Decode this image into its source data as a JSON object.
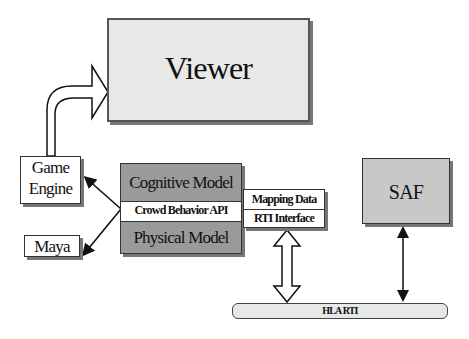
{
  "diagram": {
    "nodes": {
      "viewer": {
        "label": "Viewer"
      },
      "game_engine": {
        "line1": "Game",
        "line2": "Engine"
      },
      "maya": {
        "label": "Maya"
      },
      "cognitive_model": {
        "label": "Cognitive Model"
      },
      "crowd_behavior_api": {
        "label": "Crowd Behavior API"
      },
      "physical_model": {
        "label": "Physical Model"
      },
      "mapping_data": {
        "label": "Mapping Data"
      },
      "rti_interface": {
        "label": "RTI Interface"
      },
      "saf": {
        "label": "SAF"
      },
      "hla_rti": {
        "label": "HLA RTI"
      }
    },
    "edges": [
      {
        "from": "game_engine",
        "to": "viewer",
        "style": "hollow-curved-arrow"
      },
      {
        "from": "crowd_behavior_api",
        "to": "game_engine",
        "style": "arrow"
      },
      {
        "from": "crowd_behavior_api",
        "to": "maya",
        "style": "arrow"
      },
      {
        "from": "rti_interface",
        "to": "hla_rti",
        "style": "hollow-double-arrow"
      },
      {
        "from": "saf",
        "to": "hla_rti",
        "style": "double-arrow"
      }
    ],
    "colors": {
      "light_box": "#e6e6e6",
      "dark_box": "#9a9a9a",
      "white_box": "#ffffff",
      "line": "#222222"
    }
  }
}
